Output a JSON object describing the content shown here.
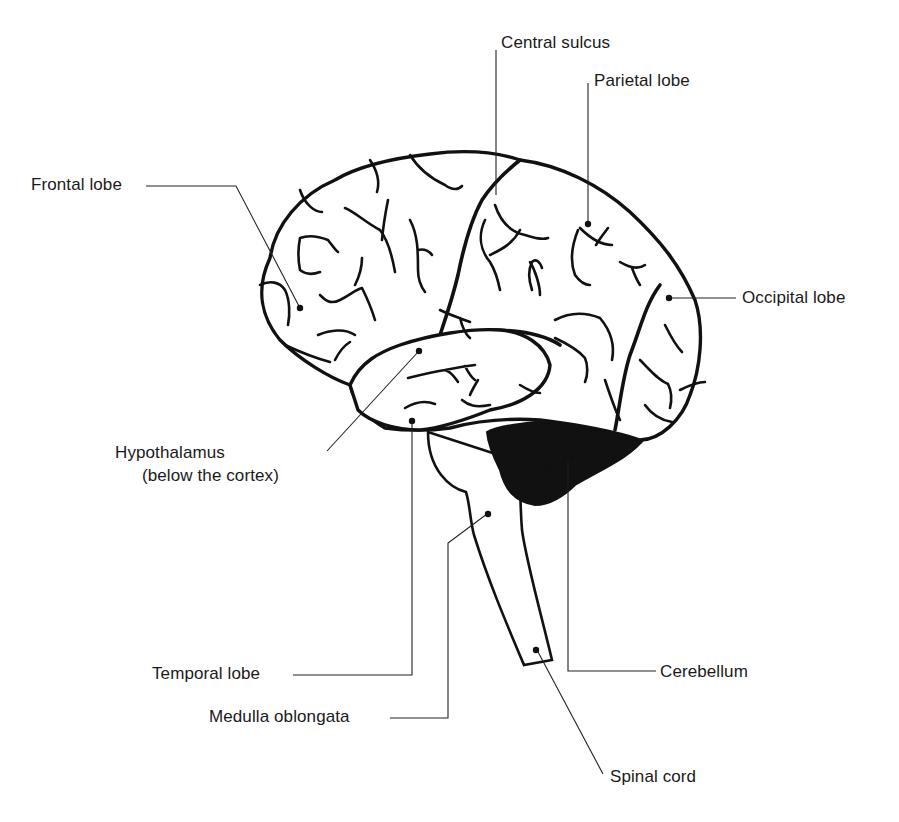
{
  "diagram": {
    "labels": {
      "central_sulcus": "Central sulcus",
      "parietal_lobe": "Parietal lobe",
      "frontal_lobe": "Frontal lobe",
      "occipital_lobe": "Occipital lobe",
      "hypothalamus": "Hypothalamus",
      "hypothalamus_note": "(below the cortex)",
      "temporal_lobe": "Temporal lobe",
      "cerebellum": "Cerebellum",
      "medulla_oblongata": "Medulla oblongata",
      "spinal_cord": "Spinal cord"
    },
    "colors": {
      "ink": "#111111",
      "background": "#ffffff"
    }
  }
}
